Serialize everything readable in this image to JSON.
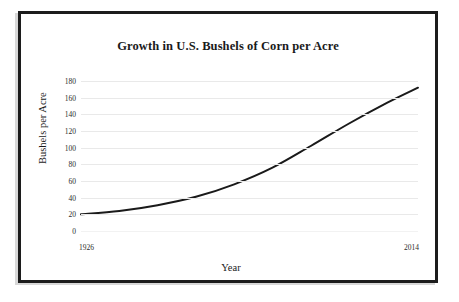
{
  "figure": {
    "title": "Growth in U.S. Bushels of Corn per Acre",
    "frame_color": "#1c1c1c",
    "background_color": "#ffffff",
    "line_color": "#1a1a1a",
    "gridline_color": "#e9e9e9"
  },
  "axes": {
    "x_axis_label": "Year",
    "y_axis_label": "Bushels per Acre",
    "x_tick_labels": [
      "1926",
      "2014"
    ],
    "y_tick_labels": [
      "180",
      "160",
      "140",
      "120",
      "100",
      "80",
      "60",
      "40",
      "20",
      "0"
    ]
  },
  "chart_data": {
    "type": "line",
    "title": "Growth in U.S. Bushels of Corn per Acre",
    "xlabel": "Year",
    "ylabel": "Bushels per Acre",
    "xlim": [
      1926,
      2014
    ],
    "ylim": [
      0,
      180
    ],
    "grid": true,
    "legend": false,
    "xticks": [
      1926,
      2014
    ],
    "yticks": [
      0,
      20,
      40,
      60,
      80,
      100,
      120,
      140,
      160,
      180
    ],
    "series": [
      {
        "name": "U.S. corn yield",
        "x": [
          1926,
          1936,
          1946,
          1956,
          1966,
          1976,
          1986,
          1996,
          2006,
          2014
        ],
        "y": [
          20,
          24,
          31,
          41,
          56,
          76,
          102,
          129,
          154,
          172
        ]
      }
    ]
  }
}
